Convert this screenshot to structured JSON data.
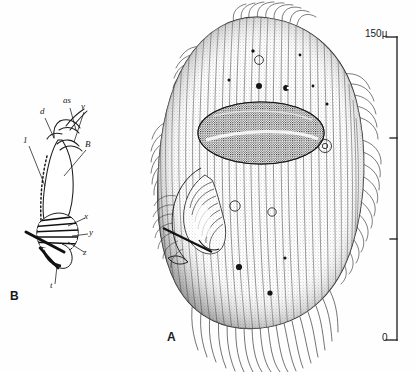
{
  "figure": {
    "background_color": "#fefefe",
    "ink_color": "#1a1a1a",
    "width": 417,
    "height": 372,
    "type": "scientific-line-illustration"
  },
  "panels": [
    {
      "id": "A",
      "label": "A",
      "label_x": 167,
      "label_y": 338,
      "description": "whole-cell ventral view of a ciliate with dense longitudinal kineties, dark stippled macronucleus, buccal cavity on left margin, and marginal cilia fringe"
    },
    {
      "id": "B",
      "label": "B",
      "label_x": 10,
      "label_y": 297,
      "description": "schematic detail of the oral apparatus and associated striated structures"
    }
  ],
  "panel_b_labels": [
    {
      "text": "d",
      "x": 42,
      "y": 112,
      "anchor_x": 54,
      "anchor_y": 138
    },
    {
      "text": "as",
      "x": 65,
      "y": 102,
      "anchor_x": 74,
      "anchor_y": 134
    },
    {
      "text": "v",
      "x": 82,
      "y": 108,
      "anchor_x": 72,
      "anchor_y": 144
    },
    {
      "text": "1",
      "x": 25,
      "y": 142,
      "anchor_x": 44,
      "anchor_y": 185
    },
    {
      "text": "B",
      "x": 86,
      "y": 146,
      "anchor_x": 63,
      "anchor_y": 174
    },
    {
      "text": "x",
      "x": 85,
      "y": 218,
      "anchor_x": 66,
      "anchor_y": 228
    },
    {
      "text": "y",
      "x": 90,
      "y": 234,
      "anchor_x": 62,
      "anchor_y": 236
    },
    {
      "text": "z",
      "x": 84,
      "y": 254,
      "anchor_x": 64,
      "anchor_y": 243
    },
    {
      "text": "t",
      "x": 51,
      "y": 287,
      "anchor_x": 54,
      "anchor_y": 264
    }
  ],
  "scale_bar": {
    "name": "magnification-scale-bar",
    "units": "micrometres",
    "top_label": "150µ",
    "bottom_label": "0",
    "top_value": 150,
    "bottom_value": 0,
    "tick_values": [
      150,
      100,
      50,
      0
    ],
    "x": 397,
    "y_top": 37,
    "y_bottom": 340,
    "top_label_x": 369,
    "top_label_y": 34,
    "bottom_label_x": 383,
    "bottom_label_y": 338
  }
}
